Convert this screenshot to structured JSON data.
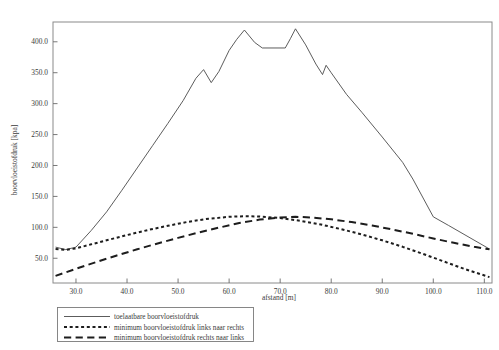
{
  "chart_data": {
    "type": "line",
    "title": "",
    "xlabel": "afstand [m]",
    "ylabel": "boorvloeistofdruk [kpa]",
    "xlim": [
      25.5,
      111.5
    ],
    "ylim": [
      10.0,
      432.0
    ],
    "grid": false,
    "legend_position": "below-axes-left",
    "xticks": [
      "30.0",
      "40.0",
      "50.0",
      "60.0",
      "70.0",
      "80.0",
      "90.0",
      "100.0",
      "110.0"
    ],
    "xtick_values": [
      30,
      40,
      50,
      60,
      70,
      80,
      90,
      100,
      110
    ],
    "yticks": [
      "50.0",
      "100.0",
      "150.0",
      "200.0",
      "250.0",
      "300.0",
      "350.0",
      "400.0"
    ],
    "ytick_values": [
      50,
      100,
      150,
      200,
      250,
      300,
      350,
      400
    ],
    "series": [
      {
        "name": "toelaatbare boorvloeistofdruk",
        "style": "solid",
        "color": "#4a4a4a",
        "width": 0.9,
        "x": [
          26.0,
          28.0,
          30.0,
          33.0,
          36.0,
          39.0,
          42.0,
          45.0,
          48.0,
          51.0,
          53.5,
          55.0,
          56.5,
          58.0,
          60.0,
          61.5,
          63.0,
          65.0,
          66.5,
          71.0,
          72.0,
          73.0,
          75.0,
          77.0,
          78.3,
          79.0,
          80.0,
          83.0,
          86.0,
          90.0,
          94.0,
          96.0,
          100.0,
          103.0,
          107.0,
          111.0
        ],
        "y": [
          68.0,
          64.0,
          68.0,
          95.0,
          125.0,
          160.0,
          196.0,
          232.0,
          268.0,
          305.0,
          341.0,
          355.0,
          334.0,
          352.0,
          386.0,
          404.0,
          419.0,
          399.0,
          390.0,
          390.0,
          405.0,
          421.0,
          395.0,
          364.0,
          347.0,
          362.0,
          350.0,
          315.0,
          286.0,
          246.0,
          205.0,
          178.0,
          117.0,
          103.0,
          84.0,
          65.0
        ]
      },
      {
        "name": "minimum boorvloeistofdruk links naar rechts",
        "style": "dotted",
        "color": "#1d1d1d",
        "width": 2.0,
        "x": [
          26.0,
          28.0,
          30.0,
          33.0,
          36.0,
          40.0,
          44.0,
          48.0,
          52.0,
          56.0,
          60.0,
          63.0,
          66.0,
          70.0,
          74.0,
          78.0,
          82.0,
          86.0,
          90.0,
          94.0,
          98.0,
          102.0,
          106.0,
          111.0
        ],
        "y": [
          65.0,
          63.5,
          66.0,
          72.5,
          79.0,
          87.5,
          95.5,
          102.5,
          109.0,
          114.0,
          117.0,
          118.0,
          117.5,
          115.0,
          110.5,
          104.5,
          97.0,
          88.5,
          79.0,
          68.5,
          57.0,
          45.0,
          33.0,
          19.5
        ]
      },
      {
        "name": "minimum boorvloeistofdruk rechts naar links",
        "style": "dashed",
        "color": "#1d1d1d",
        "width": 2.0,
        "x": [
          26.0,
          30.0,
          34.0,
          38.0,
          42.0,
          46.0,
          50.0,
          54.0,
          58.0,
          62.0,
          66.0,
          70.0,
          73.0,
          76.0,
          80.0,
          84.0,
          88.0,
          92.0,
          96.0,
          100.0,
          104.0,
          108.0,
          111.0
        ],
        "y": [
          21.5,
          33.0,
          44.0,
          54.5,
          64.5,
          74.0,
          83.0,
          91.5,
          99.5,
          107.0,
          112.5,
          116.0,
          117.0,
          116.0,
          113.0,
          108.5,
          103.0,
          96.5,
          89.5,
          82.0,
          75.0,
          68.5,
          64.5
        ]
      }
    ]
  },
  "legend": {
    "entries": [
      {
        "label": "toelaatbare boorvloeistofdruk",
        "style": "solid"
      },
      {
        "label": "minimum boorvloeistofdruk links naar rechts",
        "style": "dotted"
      },
      {
        "label": "minimum boorvloeistofdruk rechts naar links",
        "style": "dashed"
      }
    ]
  }
}
